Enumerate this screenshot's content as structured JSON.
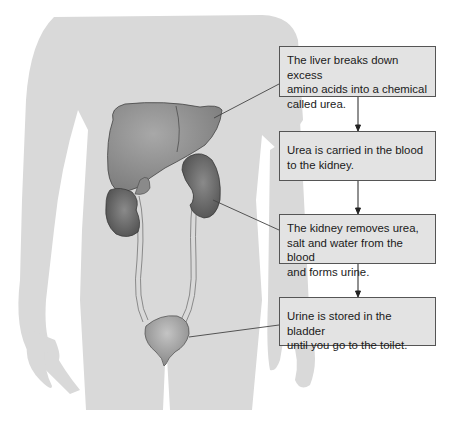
{
  "diagram": {
    "colors": {
      "body_silhouette": "#d9d9d9",
      "box_fill": "#e3e3e3",
      "box_border": "#555555",
      "liver": "#8e8e8e",
      "kidney": "#5f5f5f",
      "bladder": "#999999",
      "arrow": "#222222",
      "leader_line": "#444444"
    },
    "organs": [
      "liver",
      "kidney",
      "ureter",
      "bladder"
    ],
    "boxes": [
      {
        "id": "liver",
        "lines": [
          "The liver breaks down excess",
          "amino acids into a chemical",
          "called urea."
        ]
      },
      {
        "id": "blood",
        "lines": [
          "Urea is carried in the blood",
          "to the kidney."
        ]
      },
      {
        "id": "kidney",
        "lines": [
          "The kidney removes urea,",
          "salt and water from the blood",
          "and forms urine."
        ]
      },
      {
        "id": "bladder",
        "lines": [
          "Urine is stored in the bladder",
          "until you go to the toilet."
        ]
      }
    ],
    "flow": [
      "liver",
      "blood",
      "kidney",
      "bladder"
    ]
  }
}
